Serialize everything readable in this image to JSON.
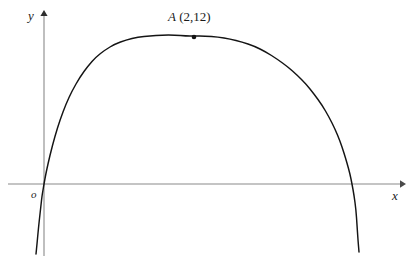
{
  "figure": {
    "type": "math-diagram",
    "background_color": "#ffffff",
    "axis_color": "#8a8a8a",
    "curve_color": "#141414",
    "text_color": "#1a1a1a"
  },
  "axes": {
    "y_label": "y",
    "x_label": "x",
    "origin_label": "o",
    "x_axis_pixel_y": 184,
    "y_axis_pixel_x": 44,
    "x_axis_start_px": 8,
    "x_axis_end_px": 406,
    "y_axis_top_px": 10,
    "y_axis_bottom_px": 256,
    "x_arrow": "right-arrowhead",
    "y_arrow": "up-arrowhead"
  },
  "annotations": {
    "point_a": {
      "name": "A",
      "coords_text": "(2,12)",
      "full_text": "A (2,12)",
      "marker": "filled-dot",
      "marker_px": {
        "x": 194,
        "y": 37
      }
    }
  },
  "chart_data": {
    "type": "line",
    "title": "",
    "xlabel": "x",
    "ylabel": "y",
    "grid": false,
    "legend": null,
    "curve_kind": "downward-opening parabola through the origin",
    "vertex": {
      "x": 2,
      "y": 12
    },
    "roots": [
      0,
      4
    ],
    "equation": "y = -3x^2 + 12x",
    "x_range_drawn": [
      -0.1,
      4.2
    ],
    "annotations": [
      {
        "label": "A (2,12)",
        "x": 2,
        "y": 12
      }
    ],
    "points_px": [
      [
        36,
        254
      ],
      [
        37,
        244
      ],
      [
        38,
        233
      ],
      [
        39,
        223
      ],
      [
        40,
        214
      ],
      [
        41,
        205
      ],
      [
        42,
        196
      ],
      [
        43,
        190
      ],
      [
        44,
        184
      ],
      [
        46,
        173
      ],
      [
        50,
        155
      ],
      [
        55,
        136
      ],
      [
        60,
        120
      ],
      [
        66,
        104
      ],
      [
        72,
        91
      ],
      [
        80,
        77
      ],
      [
        88,
        66
      ],
      [
        96,
        57
      ],
      [
        105,
        50
      ],
      [
        115,
        44
      ],
      [
        126,
        40
      ],
      [
        138,
        37
      ],
      [
        150,
        36
      ],
      [
        162,
        35
      ],
      [
        175,
        35
      ],
      [
        186,
        36
      ],
      [
        194,
        36
      ],
      [
        205,
        36
      ],
      [
        218,
        37
      ],
      [
        230,
        39
      ],
      [
        242,
        42
      ],
      [
        254,
        46
      ],
      [
        266,
        52
      ],
      [
        277,
        59
      ],
      [
        288,
        67
      ],
      [
        297,
        75
      ],
      [
        306,
        84
      ],
      [
        314,
        94
      ],
      [
        322,
        105
      ],
      [
        329,
        117
      ],
      [
        335,
        129
      ],
      [
        340,
        141
      ],
      [
        344,
        153
      ],
      [
        347,
        163
      ],
      [
        350,
        174
      ],
      [
        352,
        184
      ],
      [
        354,
        195
      ],
      [
        356,
        210
      ],
      [
        357,
        225
      ],
      [
        358,
        240
      ],
      [
        359,
        252
      ]
    ]
  }
}
